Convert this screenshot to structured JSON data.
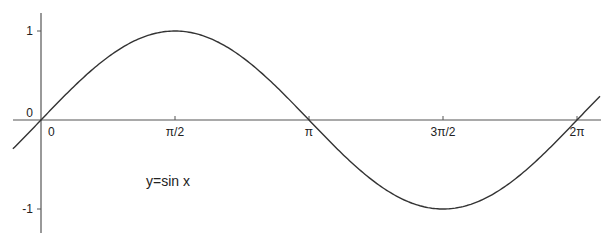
{
  "chart_data": {
    "type": "line",
    "title": "",
    "xlabel": "",
    "ylabel": "",
    "annotation": "y=sin x",
    "function": "sin(x)",
    "xlim": [
      -0.33,
      6.7
    ],
    "ylim": [
      -1.27,
      1.2
    ],
    "grid": false,
    "legend": "none",
    "x_ticks": [
      {
        "value": 0,
        "label": "0"
      },
      {
        "value": 1.5708,
        "label": "π/2"
      },
      {
        "value": 3.1416,
        "label": "π"
      },
      {
        "value": 4.7124,
        "label": "3π/2"
      },
      {
        "value": 6.2832,
        "label": "2π"
      }
    ],
    "y_ticks": [
      {
        "value": 1,
        "label": "1"
      },
      {
        "value": 0,
        "label": "0"
      },
      {
        "value": -1,
        "label": "-1"
      }
    ],
    "series": [
      {
        "name": "y=sin x",
        "x": [
          -0.33,
          0,
          0.5236,
          1.0472,
          1.5708,
          2.0944,
          2.618,
          3.1416,
          3.6652,
          4.1888,
          4.7124,
          5.236,
          5.7596,
          6.2832,
          6.55
        ],
        "values": [
          -0.32,
          0,
          0.5,
          0.866,
          1,
          0.866,
          0.5,
          0,
          -0.5,
          -0.866,
          -1,
          -0.866,
          -0.5,
          0,
          0.26
        ]
      }
    ],
    "colors": {
      "curve": "#333333",
      "axes": "#555555",
      "text": "#222222"
    }
  }
}
